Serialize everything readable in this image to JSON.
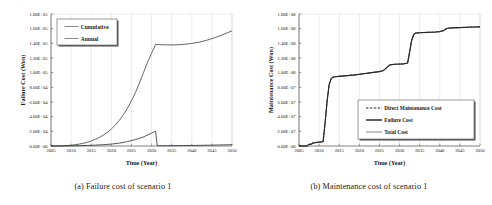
{
  "figure": {
    "panel_a_caption": "(a) Failure cost of scenario 1",
    "panel_b_caption": "(b) Maintenance cost of scenario 1"
  },
  "chart_data": [
    {
      "type": "line",
      "panel": "a",
      "title": "",
      "xlabel": "Time (Year)",
      "ylabel": "Failure Cost (Won)",
      "xlim": [
        2005,
        2050
      ],
      "ylim": [
        0,
        180000
      ],
      "xticks": [
        2005,
        2010,
        2015,
        2020,
        2025,
        2030,
        2035,
        2040,
        2045,
        2050
      ],
      "xticklabels": [
        "2005",
        "2010",
        "2015",
        "2020",
        "2025",
        "2030",
        "2035",
        "2040",
        "2045",
        "2050"
      ],
      "yticks": [
        0,
        20000,
        40000,
        60000,
        80000,
        100000,
        120000,
        140000,
        160000,
        180000
      ],
      "yticklabels": [
        "0.00E+00",
        "2.00E+04",
        "4.00E+04",
        "6.00E+04",
        "8.00E+04",
        "1.00E+05",
        "1.20E+05",
        "1.40E+05",
        "1.60E+05",
        "1.80E+05"
      ],
      "grid": false,
      "legend_position": "upper-left",
      "legend": [
        "Cumulative",
        "Annual"
      ],
      "series": [
        {
          "name": "Cumulative",
          "style": "solid",
          "x": [
            2005,
            2007,
            2009,
            2010,
            2011,
            2012,
            2013,
            2014,
            2015,
            2016,
            2017,
            2018,
            2019,
            2020,
            2021,
            2022,
            2023,
            2024,
            2025,
            2026,
            2027,
            2028,
            2029,
            2030,
            2031,
            2032,
            2034,
            2036,
            2038,
            2040,
            2042,
            2044,
            2046,
            2048,
            2050
          ],
          "values": [
            0,
            150,
            600,
            1000,
            1700,
            2600,
            3700,
            5100,
            6800,
            9000,
            11600,
            14800,
            18600,
            23200,
            28600,
            35000,
            42500,
            51500,
            61500,
            73000,
            86000,
            100000,
            114000,
            126500,
            138500,
            138200,
            137800,
            137900,
            138600,
            139800,
            141800,
            144600,
            148200,
            152400,
            157000
          ]
        },
        {
          "name": "Annual",
          "style": "solid",
          "x": [
            2005,
            2008,
            2010,
            2012,
            2014,
            2016,
            2018,
            2020,
            2022,
            2024,
            2026,
            2028,
            2030,
            2031,
            2031.4,
            2032,
            2034,
            2036,
            2038,
            2040,
            2042,
            2044,
            2046,
            2048,
            2050
          ],
          "values": [
            0,
            60,
            180,
            420,
            760,
            1200,
            1800,
            2600,
            3900,
            6000,
            8800,
            12400,
            17500,
            20200,
            600,
            350,
            400,
            500,
            620,
            760,
            920,
            1100,
            1300,
            1550,
            1850
          ]
        }
      ]
    },
    {
      "type": "line",
      "panel": "b",
      "title": "",
      "xlabel": "Time (Year)",
      "ylabel": "Maintenance Cost (Won)",
      "xlim": [
        2005,
        2050
      ],
      "ylim": [
        0,
        180000000
      ],
      "xticks": [
        2005,
        2010,
        2015,
        2020,
        2025,
        2030,
        2035,
        2040,
        2045,
        2050
      ],
      "xticklabels": [
        "2005",
        "2010",
        "2015",
        "2020",
        "2025",
        "2030",
        "2035",
        "2040",
        "2045",
        "2050"
      ],
      "yticks": [
        0,
        20000000,
        40000000,
        60000000,
        80000000,
        100000000,
        120000000,
        140000000,
        160000000,
        180000000
      ],
      "yticklabels": [
        "0.00E+00",
        "2.00E+07",
        "4.00E+07",
        "6.00E+07",
        "8.00E+07",
        "1.00E+08",
        "1.20E+08",
        "1.40E+08",
        "1.60E+08",
        "1.80E+08"
      ],
      "grid": false,
      "legend_position": "lower-right",
      "legend": [
        "Direct Maintenance Cost",
        "Failure Cost",
        "Total Cost"
      ],
      "series": [
        {
          "name": "Total Cost",
          "style": "solid-thin",
          "x": [
            2005,
            2007,
            2007.5,
            2008,
            2008.5,
            2009,
            2009.5,
            2010,
            2010.5,
            2011,
            2011.5,
            2012,
            2012.5,
            2013,
            2013.5,
            2014,
            2015,
            2017,
            2019,
            2021,
            2023,
            2025,
            2026,
            2027,
            2027.5,
            2028,
            2029,
            2031,
            2032,
            2032.5,
            2033,
            2033.5,
            2034,
            2035,
            2037,
            2039,
            2040,
            2041,
            2041.5,
            2042,
            2043,
            2045,
            2047,
            2049,
            2050
          ],
          "values": [
            0,
            0,
            2200000,
            2400000,
            4200000,
            4400000,
            5000000,
            5200000,
            5400000,
            6000000,
            32000000,
            62000000,
            84000000,
            92000000,
            94000000,
            94500000,
            95000000,
            96000000,
            97000000,
            98500000,
            100000000,
            101500000,
            103000000,
            108000000,
            110500000,
            111000000,
            111500000,
            112000000,
            113000000,
            128000000,
            144000000,
            152000000,
            154000000,
            154500000,
            155000000,
            155500000,
            156000000,
            157500000,
            159500000,
            160500000,
            161000000,
            161500000,
            162000000,
            162300000,
            162500000
          ]
        },
        {
          "name": "Failure Cost",
          "style": "solid-thick",
          "x": [
            2005,
            2007,
            2007.5,
            2008,
            2008.5,
            2009,
            2009.5,
            2010,
            2010.5,
            2011,
            2011.5,
            2012,
            2012.5,
            2013,
            2013.5,
            2014,
            2015,
            2017,
            2019,
            2021,
            2023,
            2025,
            2026,
            2027,
            2027.5,
            2028,
            2029,
            2031,
            2032,
            2032.5,
            2033,
            2033.5,
            2034,
            2035,
            2037,
            2039,
            2040,
            2041,
            2041.5,
            2042,
            2043,
            2045,
            2047,
            2049,
            2050
          ],
          "values": [
            0,
            0,
            2200000,
            2400000,
            4200000,
            4400000,
            5000000,
            5200000,
            5400000,
            6000000,
            32000000,
            62000000,
            84000000,
            92000000,
            94000000,
            94500000,
            95000000,
            96000000,
            97000000,
            98500000,
            100000000,
            101500000,
            103000000,
            108000000,
            110500000,
            111000000,
            111500000,
            112000000,
            113000000,
            128000000,
            144000000,
            152000000,
            154000000,
            154500000,
            155000000,
            155500000,
            156000000,
            157500000,
            159500000,
            160500000,
            161000000,
            161500000,
            162000000,
            162300000,
            162500000
          ]
        },
        {
          "name": "Direct Maintenance Cost",
          "style": "dashed",
          "x": [
            2005,
            2007,
            2007.5,
            2008,
            2008.5,
            2009,
            2009.5,
            2010,
            2010.5,
            2011,
            2011.5,
            2012,
            2012.5,
            2013,
            2013.5,
            2014,
            2015,
            2017,
            2019,
            2021,
            2023,
            2025,
            2026,
            2027,
            2027.5,
            2028,
            2029,
            2031,
            2032,
            2032.5,
            2033,
            2033.5,
            2034,
            2035,
            2037,
            2039,
            2040,
            2041,
            2041.5,
            2042,
            2043,
            2045,
            2047,
            2049,
            2050
          ],
          "values": [
            0,
            0,
            2200000,
            2400000,
            4200000,
            4400000,
            5000000,
            5200000,
            5400000,
            6000000,
            32000000,
            62000000,
            84000000,
            92000000,
            94000000,
            94500000,
            95000000,
            96000000,
            97000000,
            98500000,
            100000000,
            101500000,
            103000000,
            108000000,
            110500000,
            111000000,
            111500000,
            112000000,
            113000000,
            128000000,
            144000000,
            152000000,
            154000000,
            154500000,
            155000000,
            155500000,
            156000000,
            157500000,
            159500000,
            160500000,
            161000000,
            161500000,
            162000000,
            162300000,
            162500000
          ]
        }
      ]
    }
  ]
}
